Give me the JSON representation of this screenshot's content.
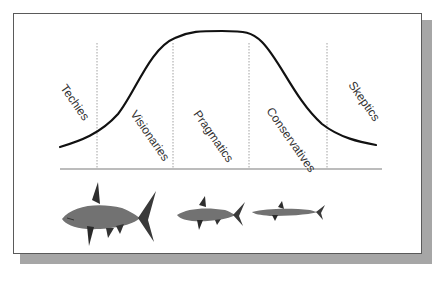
{
  "diagram": {
    "title": "",
    "type": "technology adoption lifecycle bell curve",
    "segments": [
      {
        "label": "Techies"
      },
      {
        "label": "Visionaries"
      },
      {
        "label": "Pragmatics"
      },
      {
        "label": "Conservatives"
      },
      {
        "label": "Skeptics"
      }
    ],
    "illustrations": [
      {
        "name": "large-shark",
        "description": "large shark"
      },
      {
        "name": "medium-shark",
        "description": "medium shark"
      },
      {
        "name": "small-shark",
        "description": "small shark"
      }
    ],
    "colors": {
      "curve": "#111111",
      "divider": "#888888",
      "baseline": "#777777",
      "frame_border": "#5a5a5a",
      "shadow": "#a6a6a6",
      "shark": "#6e6e6e",
      "shark_dark": "#2e2e2e"
    }
  }
}
